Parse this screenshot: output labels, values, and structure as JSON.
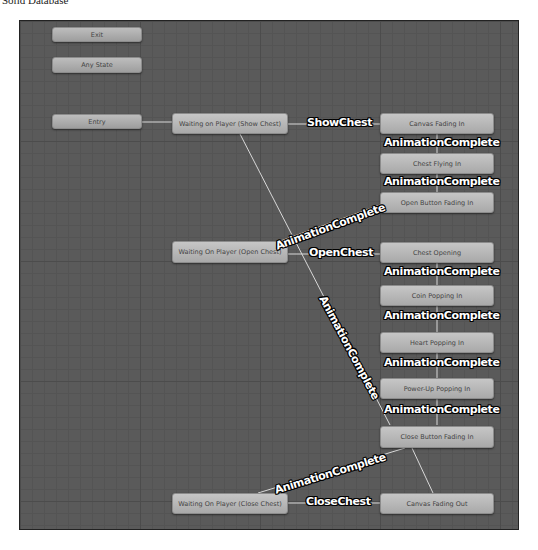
{
  "caption": "Solid Database",
  "colors": {
    "canvas_bg": "#5a5a5a",
    "node_bg": "#b8b8b8",
    "edge": "#d8d8d8",
    "label_text": "#ffffff",
    "label_outline": "#000000"
  },
  "states": {
    "exit": "Exit",
    "any_state": "Any State",
    "entry": "Entry",
    "waiting_show_chest": "Waiting on Player (Show Chest)",
    "waiting_open_chest": "Waiting On Player (Open Chest)",
    "waiting_close_chest": "Waiting On Player (Close Chest)",
    "canvas_fading_in": "Canvas Fading In",
    "chest_flying_in": "Chest Flying In",
    "open_button_fading_in": "Open Button Fading In",
    "chest_opening": "Chest Opening",
    "coin_popping_in": "Coin Popping In",
    "heart_popping_in": "Heart Popping In",
    "power_up_popping_in": "Power-Up Popping In",
    "close_button_fading_in": "Close Button Fading In",
    "canvas_fading_out": "Canvas Fading Out"
  },
  "transitions": {
    "show_chest": "ShowChest",
    "open_chest": "OpenChest",
    "close_chest": "CloseChest",
    "anim_1": "AnimationComplete",
    "anim_2": "AnimationComplete",
    "anim_3": "AnimationComplete",
    "anim_4": "AnimationComplete",
    "anim_5": "AnimationComplete",
    "anim_6": "AnimationComplete",
    "anim_7": "AnimationComplete",
    "anim_8": "AnimationComplete",
    "anim_9": "AnimationComplete"
  }
}
